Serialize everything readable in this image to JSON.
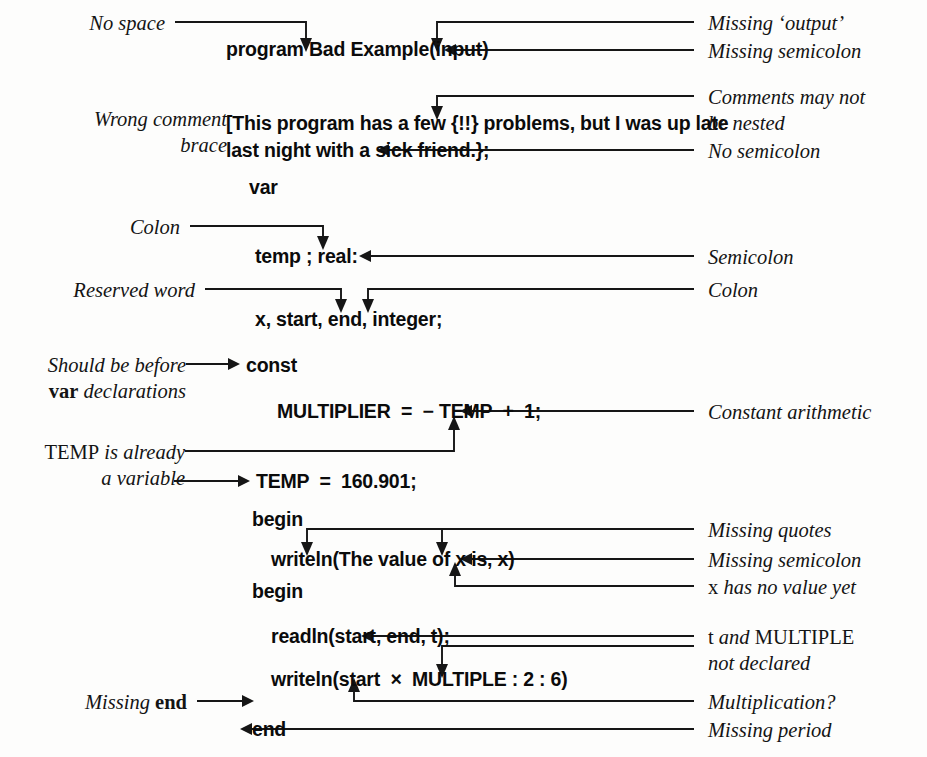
{
  "figure": {
    "ink_color": "#161616",
    "paper_color": "#fdfdfc"
  },
  "code_lines": [
    {
      "id": "line-program",
      "kw": "program",
      "rest": " Bad Example(input)"
    },
    {
      "id": "line-comment-1",
      "kw": "",
      "rest": "[This program has a few {!!} problems, but I was up late"
    },
    {
      "id": "line-comment-2",
      "kw": "",
      "rest": "last night with a sick friend.};"
    },
    {
      "id": "line-var",
      "kw": "var",
      "rest": ""
    },
    {
      "id": "line-temp",
      "kw": "",
      "rest": "temp ; real:"
    },
    {
      "id": "line-x",
      "kw": "",
      "rest": "x, start, end, integer;"
    },
    {
      "id": "line-const",
      "kw": "const",
      "rest": ""
    },
    {
      "id": "line-multiplier",
      "kw": "",
      "rest": "MULTIPLIER  =  − TEMP  +  1;"
    },
    {
      "id": "line-temp-const",
      "kw": "",
      "rest": "TEMP  =  160.901;"
    },
    {
      "id": "line-begin-1",
      "kw": "begin",
      "rest": ""
    },
    {
      "id": "line-writeln-1",
      "kw": "",
      "rest": "writeln(The value of x is, x)"
    },
    {
      "id": "line-begin-2",
      "kw": "begin",
      "rest": ""
    },
    {
      "id": "line-readln",
      "kw": "",
      "rest": "readln(start, end, t);"
    },
    {
      "id": "line-writeln-2",
      "kw": "",
      "rest": "writeln(start  ×  MULTIPLE : 2 : 6)"
    },
    {
      "id": "line-end",
      "kw": "end",
      "rest": ""
    }
  ],
  "annotations_left": [
    {
      "id": "ann-no-space",
      "lines": [
        {
          "parts": [
            {
              "text": "No space",
              "style": "it"
            }
          ]
        }
      ]
    },
    {
      "id": "ann-wrong-brace",
      "lines": [
        {
          "parts": [
            {
              "text": "Wrong comment",
              "style": "it"
            }
          ]
        },
        {
          "parts": [
            {
              "text": "brace",
              "style": "it"
            }
          ]
        }
      ]
    },
    {
      "id": "ann-colon",
      "lines": [
        {
          "parts": [
            {
              "text": "Colon",
              "style": "it"
            }
          ]
        }
      ]
    },
    {
      "id": "ann-reserved-word",
      "lines": [
        {
          "parts": [
            {
              "text": "Reserved word",
              "style": "it"
            }
          ]
        }
      ]
    },
    {
      "id": "ann-should-be-before",
      "lines": [
        {
          "parts": [
            {
              "text": "Should be before",
              "style": "it"
            }
          ]
        },
        {
          "parts": [
            {
              "text": "var",
              "style": "bd"
            },
            {
              "text": " declarations",
              "style": "it"
            }
          ]
        }
      ]
    },
    {
      "id": "ann-temp-variable",
      "lines": [
        {
          "parts": [
            {
              "text": "TEMP",
              "style": "rm"
            },
            {
              "text": " is already",
              "style": "it"
            }
          ]
        },
        {
          "parts": [
            {
              "text": "a variable",
              "style": "it"
            }
          ]
        }
      ]
    },
    {
      "id": "ann-missing-end",
      "lines": [
        {
          "parts": [
            {
              "text": "Missing ",
              "style": "it"
            },
            {
              "text": "end",
              "style": "bd"
            }
          ]
        }
      ]
    }
  ],
  "annotations_right": [
    {
      "id": "ann-missing-output",
      "lines": [
        {
          "parts": [
            {
              "text": "Missing ‘output’",
              "style": "it"
            }
          ]
        }
      ]
    },
    {
      "id": "ann-missing-semicolon-1",
      "lines": [
        {
          "parts": [
            {
              "text": "Missing semicolon",
              "style": "it"
            }
          ]
        }
      ]
    },
    {
      "id": "ann-comments-nested",
      "lines": [
        {
          "parts": [
            {
              "text": "Comments may not",
              "style": "it"
            }
          ]
        },
        {
          "parts": [
            {
              "text": "be nested",
              "style": "it"
            }
          ]
        }
      ]
    },
    {
      "id": "ann-no-semicolon",
      "lines": [
        {
          "parts": [
            {
              "text": "No semicolon",
              "style": "it"
            }
          ]
        }
      ]
    },
    {
      "id": "ann-semicolon",
      "lines": [
        {
          "parts": [
            {
              "text": "Semicolon",
              "style": "it"
            }
          ]
        }
      ]
    },
    {
      "id": "ann-colon-right",
      "lines": [
        {
          "parts": [
            {
              "text": "Colon",
              "style": "it"
            }
          ]
        }
      ]
    },
    {
      "id": "ann-constant-arith",
      "lines": [
        {
          "parts": [
            {
              "text": "Constant arithmetic",
              "style": "it"
            }
          ]
        }
      ]
    },
    {
      "id": "ann-missing-quotes",
      "lines": [
        {
          "parts": [
            {
              "text": "Missing quotes",
              "style": "it"
            }
          ]
        }
      ]
    },
    {
      "id": "ann-missing-semicolon-2",
      "lines": [
        {
          "parts": [
            {
              "text": "Missing semicolon",
              "style": "it"
            }
          ]
        }
      ]
    },
    {
      "id": "ann-x-no-value",
      "lines": [
        {
          "parts": [
            {
              "text": "x",
              "style": "rm"
            },
            {
              "text": " has no value yet",
              "style": "it"
            }
          ]
        }
      ]
    },
    {
      "id": "ann-not-declared",
      "lines": [
        {
          "parts": [
            {
              "text": "t",
              "style": "rm"
            },
            {
              "text": " and ",
              "style": "it"
            },
            {
              "text": "MULTIPLE",
              "style": "rm"
            }
          ]
        },
        {
          "parts": [
            {
              "text": "not declared",
              "style": "it"
            }
          ]
        }
      ]
    },
    {
      "id": "ann-multiplication",
      "lines": [
        {
          "parts": [
            {
              "text": "Multiplication?",
              "style": "it"
            }
          ]
        }
      ]
    },
    {
      "id": "ann-missing-period",
      "lines": [
        {
          "parts": [
            {
              "text": "Missing period",
              "style": "it"
            }
          ]
        }
      ]
    }
  ]
}
